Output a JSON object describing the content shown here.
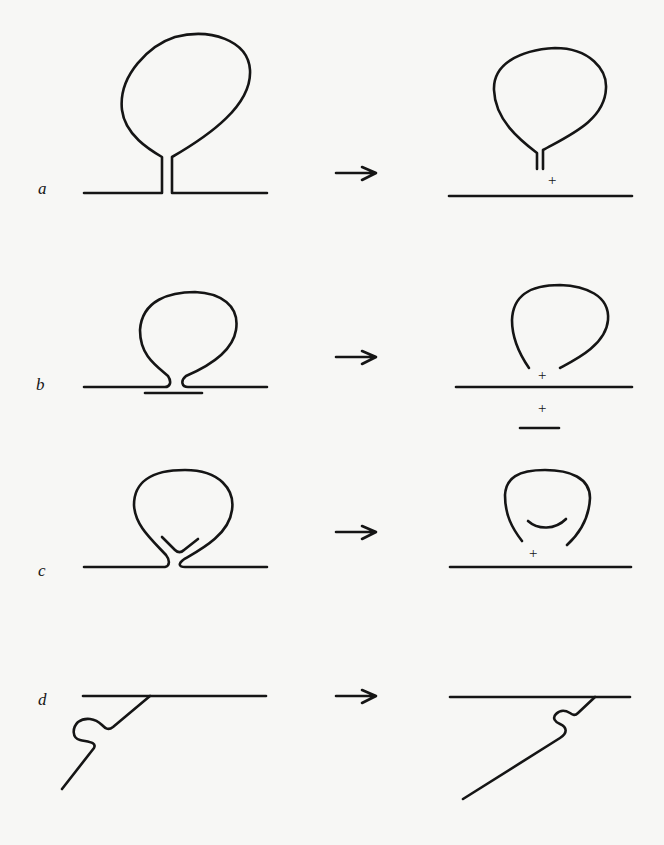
{
  "figure": {
    "panels": [
      {
        "label": "a",
        "left_state": "vesicle with long stalk attached to membrane",
        "right_state": "vesicle detached with stalk, membrane sealed",
        "plus_marks": [
          "+"
        ]
      },
      {
        "label": "b",
        "left_state": "vesicle with short neck, patch under membrane",
        "right_state": "open vesicle, membrane sealed, patch separated",
        "plus_marks": [
          "+",
          "+"
        ]
      },
      {
        "label": "c",
        "left_state": "vesicle with inner V-shaped neck",
        "right_state": "open vesicle with inner arc, membrane sealed",
        "plus_marks": [
          "+"
        ]
      },
      {
        "label": "d",
        "left_state": "filament with S-bend attached to membrane",
        "right_state": "filament with S-bend shifted along membrane",
        "plus_marks": []
      }
    ],
    "arrow_symbol": "→",
    "plus_symbol": "+"
  }
}
